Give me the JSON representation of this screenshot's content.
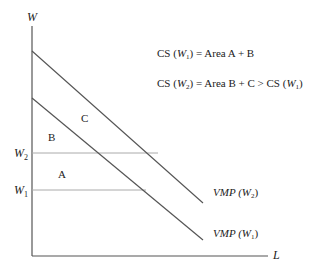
{
  "diagram": {
    "axes": {
      "y_label": "W",
      "x_label": "L"
    },
    "wage_levels": {
      "w2_label_main": "W",
      "w2_label_sub": "2",
      "w1_label_main": "W",
      "w1_label_sub": "1"
    },
    "areas": {
      "a": "A",
      "b": "B",
      "c": "C"
    },
    "curves": {
      "upper": {
        "main": "VMP",
        "paren_open": " (W",
        "sub": "2",
        "paren_close": ")"
      },
      "lower": {
        "main": "VMP",
        "paren_open": " (W",
        "sub": "1",
        "paren_close": ")"
      }
    },
    "equations": {
      "eq1": {
        "a": "CS (",
        "w": "W",
        "sub": "1",
        "b": ") = Area A + B"
      },
      "eq2": {
        "a": "CS (",
        "w": "W",
        "sub": "2",
        "b": ") = Area B + C > CS (",
        "w2": "W",
        "sub2": "1",
        "c": ")"
      }
    },
    "colors": {
      "line": "#555555",
      "guide": "#aaaaaa",
      "text": "#222222"
    }
  }
}
